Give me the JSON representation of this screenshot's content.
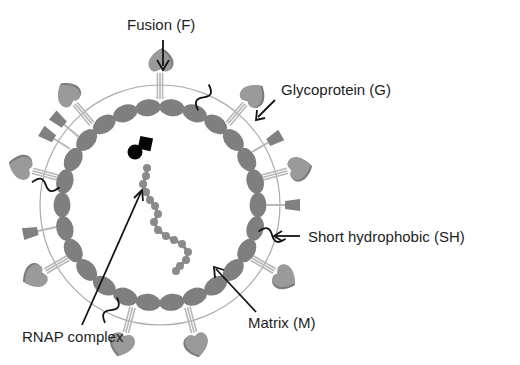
{
  "diagram": {
    "type": "virion-schematic",
    "colors": {
      "background": "#ffffff",
      "matrix": "#7f7f7f",
      "membrane": "#aaaaaa",
      "fusion_head": "#9a9a9a",
      "fusion_head_shadow": "#7c7c7c",
      "stalk": "#b8b8b8",
      "glyco": "#808080",
      "sh": "#111111",
      "rnap": "#050505",
      "rna": "#8a8a8a",
      "arrow": "#141414",
      "text": "#1e1e1e"
    },
    "labels": {
      "fusion": "Fusion (F)",
      "glycoprotein": "Glycoprotein (G)",
      "short_hydrophobic": "Short hydrophobic (SH)",
      "matrix": "Matrix (M)",
      "rnap": "RNAP complex"
    },
    "geometry": {
      "center": [
        160,
        205
      ],
      "membrane_radius": 120,
      "matrix_radius": 98,
      "fusion_angles_deg": [
        -90,
        -50,
        -130,
        -15,
        30,
        75,
        105,
        150,
        -165
      ],
      "glyco_angles_deg": [
        -30,
        0,
        168,
        -148,
        -140
      ],
      "sh_angles_deg": [
        -68,
        15,
        190,
        115
      ]
    }
  }
}
